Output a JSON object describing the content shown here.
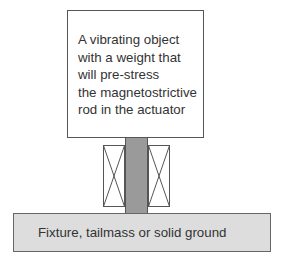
{
  "diagram": {
    "top_box": {
      "label": "A vibrating object\nwith a weight that\nwill pre-stress\nthe magnetostrictive\nrod in the actuator"
    },
    "rod": {
      "name": "magnetostrictive-rod",
      "color": "#9a9a9a"
    },
    "coils": [
      {
        "name": "left-coil",
        "symbol": "crossed-box"
      },
      {
        "name": "right-coil",
        "symbol": "crossed-box"
      }
    ],
    "base": {
      "label": "Fixture, tailmass or solid ground",
      "color": "#dddddd"
    }
  }
}
